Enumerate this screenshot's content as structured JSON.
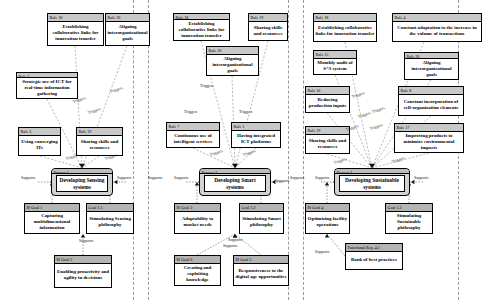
{
  "diagram": {
    "type": "layered-goal-process-rule-diagram",
    "colors": {
      "node_fill": "#ffffff",
      "header_fill": "#c8c8c8",
      "goal_header_fill": "#b4b4b4",
      "process_fill": "#d2d2d2",
      "stroke": "#000000",
      "lane_divider": "#9a9a9a"
    },
    "lane_dividers_x": [
      133,
      148,
      288,
      303,
      458
    ],
    "edge_label_triggers": "Triggers",
    "edge_label_supports": "Supports"
  },
  "nodes": [
    {
      "id": "r18a",
      "stereotype": "Rule 18",
      "label": "Establishing collaborative links for innovation transfer",
      "kind": "rule",
      "x": 47,
      "y": 13,
      "w": 57,
      "h": 33
    },
    {
      "id": "r20a",
      "stereotype": "Rule 20",
      "label": "Aligning interorganizational goals",
      "kind": "rule",
      "x": 105,
      "y": 13,
      "w": 45,
      "h": 33
    },
    {
      "id": "r18b",
      "stereotype": "Rule 18",
      "label": "Establishing collaborative links for innovation transfer",
      "kind": "rule",
      "x": 173,
      "y": 13,
      "w": 57,
      "h": 28
    },
    {
      "id": "r19a",
      "stereotype": "Rule 19",
      "label": "Sharing skills and resources",
      "kind": "rule",
      "x": 248,
      "y": 13,
      "w": 40,
      "h": 28
    },
    {
      "id": "r18c",
      "stereotype": "Rule 18",
      "label": "Establishing collaborative links for innovation transfer",
      "kind": "rule",
      "x": 313,
      "y": 13,
      "w": 64,
      "h": 29
    },
    {
      "id": "r4",
      "stereotype": "Rule 4",
      "label": "Constant adaptation to the increase in the volume of transactions",
      "kind": "rule",
      "x": 392,
      "y": 13,
      "w": 90,
      "h": 29
    },
    {
      "id": "r2",
      "stereotype": "Rule 2",
      "label": "Strategic use of ICT for real-time information gathering",
      "kind": "rule",
      "x": 16,
      "y": 72,
      "w": 62,
      "h": 27
    },
    {
      "id": "r20b",
      "stereotype": "Rule 20",
      "label": "Aligning interorganizational goals",
      "kind": "rule",
      "x": 206,
      "y": 46,
      "w": 53,
      "h": 30
    },
    {
      "id": "r15",
      "stereotype": "Rule 15",
      "label": "Monthly audit of S^3 system",
      "kind": "rule",
      "x": 313,
      "y": 50,
      "w": 44,
      "h": 25
    },
    {
      "id": "r20c",
      "stereotype": "Rule 20",
      "label": "Aligning interorganizational goals",
      "kind": "rule",
      "x": 404,
      "y": 52,
      "w": 55,
      "h": 28
    },
    {
      "id": "r16",
      "stereotype": "Rule 16",
      "label": "Reducing production inputs",
      "kind": "rule",
      "x": 305,
      "y": 86,
      "w": 45,
      "h": 27
    },
    {
      "id": "r8",
      "stereotype": "Rule 8",
      "label": "Constant incorporation of self-organization elements",
      "kind": "rule",
      "x": 398,
      "y": 86,
      "w": 66,
      "h": 30
    },
    {
      "id": "r3",
      "stereotype": "Rule 3",
      "label": "Using converging ITs",
      "kind": "rule",
      "x": 18,
      "y": 127,
      "w": 43,
      "h": 29
    },
    {
      "id": "r19b",
      "stereotype": "Rule 19",
      "label": "Sharing skills and resources",
      "kind": "rule",
      "x": 76,
      "y": 127,
      "w": 47,
      "h": 29
    },
    {
      "id": "r7",
      "stereotype": "Rule 7",
      "label": "Continuous use of intelligent services",
      "kind": "rule",
      "x": 166,
      "y": 122,
      "w": 54,
      "h": 26
    },
    {
      "id": "r1",
      "stereotype": "Rule 1",
      "label": "Having integrated ICT platforms",
      "kind": "rule",
      "x": 231,
      "y": 122,
      "w": 50,
      "h": 26
    },
    {
      "id": "r19c",
      "stereotype": "Rule 19",
      "label": "Sharing skills and resources",
      "kind": "rule",
      "x": 305,
      "y": 126,
      "w": 45,
      "h": 28
    },
    {
      "id": "r17",
      "stereotype": "Rule 17",
      "label": "Improving products to minimize environmental impacts",
      "kind": "rule",
      "x": 394,
      "y": 123,
      "w": 70,
      "h": 30
    },
    {
      "id": "p1",
      "stereotype": "Process 1",
      "label": "Developing Sensing systems",
      "kind": "process",
      "x": 51,
      "y": 168,
      "w": 62,
      "h": 28
    },
    {
      "id": "p2",
      "stereotype": "Process 2",
      "label": "Developing Smart systems",
      "kind": "process",
      "x": 199,
      "y": 168,
      "w": 72,
      "h": 28
    },
    {
      "id": "p3",
      "stereotype": "Process 3",
      "label": "Developing Sustainable systems",
      "kind": "process",
      "x": 334,
      "y": 168,
      "w": 76,
      "h": 28
    },
    {
      "id": "g1",
      "stereotype": "IS Goal 1",
      "label": "Capturing multidimensional information",
      "kind": "goal",
      "x": 24,
      "y": 203,
      "w": 56,
      "h": 31
    },
    {
      "id": "g11",
      "stereotype": "Goal 1.1",
      "label": "Stimulating Sensing philosophy",
      "kind": "goal",
      "x": 86,
      "y": 203,
      "w": 48,
      "h": 31
    },
    {
      "id": "g2",
      "stereotype": "IS Goal 2",
      "label": "Enabling proactivity and agility in decisions",
      "kind": "goal",
      "x": 54,
      "y": 255,
      "w": 58,
      "h": 33
    },
    {
      "id": "g3",
      "stereotype": "IS Goal 3",
      "label": "Adaptability to market needs",
      "kind": "goal",
      "x": 174,
      "y": 203,
      "w": 47,
      "h": 31
    },
    {
      "id": "g12",
      "stereotype": "Goal 1.2",
      "label": "Stimulating Smart philosophy",
      "kind": "goal",
      "x": 239,
      "y": 203,
      "w": 45,
      "h": 31
    },
    {
      "id": "g6",
      "stereotype": "IS Goal 6",
      "label": "Creating and exploiting knowledge",
      "kind": "goal",
      "x": 174,
      "y": 255,
      "w": 47,
      "h": 31
    },
    {
      "id": "g5",
      "stereotype": "IS Goal 5",
      "label": "Responsiveness to the digital age opportunities",
      "kind": "goal",
      "x": 233,
      "y": 255,
      "w": 56,
      "h": 31
    },
    {
      "id": "g4",
      "stereotype": "IS Goal 4",
      "label": "Optimizing facility operations",
      "kind": "goal",
      "x": 305,
      "y": 203,
      "w": 45,
      "h": 31
    },
    {
      "id": "g13",
      "stereotype": "Goal 1.3",
      "label": "Stimulating Sustainable philosophy",
      "kind": "goal",
      "x": 385,
      "y": 203,
      "w": 48,
      "h": 31
    },
    {
      "id": "fr61",
      "stereotype": "Functional Req. 4.1",
      "label": "Bank of best practices",
      "kind": "goal",
      "x": 345,
      "y": 243,
      "w": 58,
      "h": 27
    }
  ],
  "edge_labels": [
    {
      "text": "Triggers",
      "x": 73,
      "y": 100,
      "rot": true
    },
    {
      "text": "Triggers",
      "x": 88,
      "y": 111,
      "rot": true
    },
    {
      "text": "Triggers",
      "x": 110,
      "y": 90,
      "rot": true
    },
    {
      "text": "Triggers",
      "x": 66,
      "y": 157,
      "rot": true
    },
    {
      "text": "Triggers",
      "x": 105,
      "y": 157,
      "rot": true
    },
    {
      "text": "Triggers",
      "x": 200,
      "y": 84,
      "rot": false
    },
    {
      "text": "Triggers",
      "x": 184,
      "y": 110,
      "rot": false
    },
    {
      "text": "Triggers",
      "x": 239,
      "y": 110,
      "rot": false
    },
    {
      "text": "Triggers",
      "x": 210,
      "y": 153,
      "rot": true
    },
    {
      "text": "Triggers",
      "x": 243,
      "y": 153,
      "rot": true
    },
    {
      "text": "Triggers",
      "x": 352,
      "y": 95,
      "rot": true
    },
    {
      "text": "Triggers",
      "x": 358,
      "y": 115,
      "rot": true
    },
    {
      "text": "Triggers",
      "x": 346,
      "y": 128,
      "rot": true
    },
    {
      "text": "Triggers",
      "x": 370,
      "y": 127,
      "rot": true
    },
    {
      "text": "Triggers",
      "x": 372,
      "y": 110,
      "rot": true
    },
    {
      "text": "Triggers",
      "x": 334,
      "y": 161,
      "rot": true
    },
    {
      "text": "Triggers",
      "x": 392,
      "y": 160,
      "rot": true
    },
    {
      "text": "Supports",
      "x": 21,
      "y": 176,
      "rot": false
    },
    {
      "text": "Supports",
      "x": 117,
      "y": 176,
      "rot": false
    },
    {
      "text": "Supports",
      "x": 79,
      "y": 239,
      "rot": false
    },
    {
      "text": "Supports",
      "x": 148,
      "y": 176,
      "rot": false
    },
    {
      "text": "Supports",
      "x": 174,
      "y": 176,
      "rot": false
    },
    {
      "text": "Supports",
      "x": 275,
      "y": 179,
      "rot": false
    },
    {
      "text": "Supports",
      "x": 228,
      "y": 238,
      "rot": false
    },
    {
      "text": "Supports",
      "x": 223,
      "y": 244,
      "rot": false
    },
    {
      "text": "Supports",
      "x": 290,
      "y": 176,
      "rot": false
    },
    {
      "text": "Supports",
      "x": 315,
      "y": 176,
      "rot": false
    },
    {
      "text": "Supports",
      "x": 414,
      "y": 176,
      "rot": false
    },
    {
      "text": "Supports",
      "x": 315,
      "y": 250,
      "rot": false
    }
  ],
  "trigger_edges": [
    {
      "from": [
        75,
        46
      ],
      "to": [
        82,
        168
      ]
    },
    {
      "from": [
        127,
        46
      ],
      "to": [
        82,
        168
      ]
    },
    {
      "from": [
        47,
        99
      ],
      "to": [
        82,
        168
      ]
    },
    {
      "from": [
        40,
        156
      ],
      "to": [
        82,
        168
      ]
    },
    {
      "from": [
        99,
        156
      ],
      "to": [
        82,
        168
      ]
    },
    {
      "from": [
        201,
        41
      ],
      "to": [
        235,
        168
      ]
    },
    {
      "from": [
        268,
        41
      ],
      "to": [
        235,
        168
      ]
    },
    {
      "from": [
        232,
        76
      ],
      "to": [
        235,
        168
      ]
    },
    {
      "from": [
        193,
        148
      ],
      "to": [
        235,
        168
      ]
    },
    {
      "from": [
        256,
        148
      ],
      "to": [
        235,
        168
      ]
    },
    {
      "from": [
        345,
        42
      ],
      "to": [
        372,
        168
      ]
    },
    {
      "from": [
        424,
        42
      ],
      "to": [
        372,
        168
      ]
    },
    {
      "from": [
        335,
        75
      ],
      "to": [
        372,
        168
      ]
    },
    {
      "from": [
        431,
        80
      ],
      "to": [
        372,
        168
      ]
    },
    {
      "from": [
        327,
        113
      ],
      "to": [
        372,
        168
      ]
    },
    {
      "from": [
        431,
        116
      ],
      "to": [
        372,
        168
      ]
    },
    {
      "from": [
        327,
        154
      ],
      "to": [
        372,
        168
      ]
    },
    {
      "from": [
        429,
        153
      ],
      "to": [
        372,
        168
      ]
    }
  ],
  "support_edges": [
    {
      "from": [
        52,
        203
      ],
      "to": [
        52,
        182
      ],
      "kind": "v"
    },
    {
      "from": [
        110,
        203
      ],
      "to": [
        110,
        182
      ],
      "kind": "v"
    },
    {
      "from": [
        83,
        255
      ],
      "to": [
        83,
        234
      ],
      "kind": "v"
    },
    {
      "from": [
        197,
        203
      ],
      "to": [
        197,
        182
      ],
      "kind": "v"
    },
    {
      "from": [
        261,
        203
      ],
      "to": [
        261,
        182
      ],
      "kind": "v"
    },
    {
      "from": [
        197,
        255
      ],
      "to": [
        235,
        234
      ],
      "kind": "v"
    },
    {
      "from": [
        261,
        255
      ],
      "to": [
        235,
        234
      ],
      "kind": "v"
    },
    {
      "from": [
        327,
        203
      ],
      "to": [
        327,
        182
      ],
      "kind": "v"
    },
    {
      "from": [
        409,
        203
      ],
      "to": [
        409,
        182
      ],
      "kind": "v"
    },
    {
      "from": [
        345,
        256
      ],
      "to": [
        327,
        234
      ],
      "kind": "v"
    }
  ]
}
